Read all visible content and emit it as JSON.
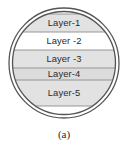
{
  "figure": {
    "caption": "(a)",
    "shape": "circle-double-ring",
    "colors": {
      "outline": "#555555",
      "band_separator": "#8c8c8c",
      "fill_gray": "#e2e2e2",
      "fill_gray_dark": "#dcdcdc",
      "fill_white": "#ffffff",
      "text": "#2b2b2b",
      "background": "#ffffff"
    },
    "layers": [
      {
        "label": "Layer-1",
        "fill": "#e2e2e2",
        "y_top": 14.0,
        "y_bottom": 32.0
      },
      {
        "label": "Layer -2",
        "fill": "#ffffff",
        "y_top": 32.0,
        "y_bottom": 50.0
      },
      {
        "label": "Layer -3",
        "fill": "#e2e2e2",
        "y_top": 50.0,
        "y_bottom": 68.0
      },
      {
        "label": "Layer-4",
        "fill": "#dcdcdc",
        "y_top": 68.0,
        "y_bottom": 80.0
      },
      {
        "label": "Layer-5",
        "fill": "#e2e2e2",
        "y_top": 80.0,
        "y_bottom": 106.0
      }
    ],
    "circle": {
      "cx": 64,
      "cy": 63,
      "outer_r": 55,
      "inner_r": 51.5
    }
  }
}
